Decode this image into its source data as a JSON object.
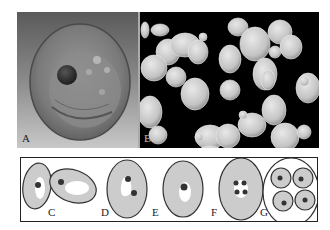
{
  "figure": {
    "panels": [
      {
        "id": "A",
        "label": "A",
        "description": "3D rendered yeast cell with nucleus"
      },
      {
        "id": "B",
        "label": "B",
        "description": "SEM micrograph of budding yeast cells"
      }
    ],
    "schematic": {
      "labels": [
        "C",
        "D",
        "E",
        "F",
        "G"
      ]
    }
  }
}
